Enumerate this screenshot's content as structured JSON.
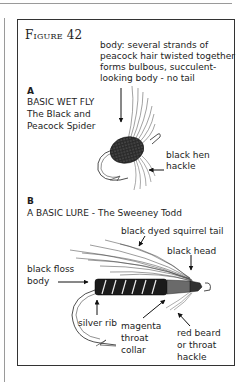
{
  "figure": {
    "title": "Figure 42"
  },
  "section_a": {
    "letter": "A",
    "heading": "BASIC WET FLY",
    "name_line1": "The Black and",
    "name_line2": "Peacock Spider",
    "labels": {
      "body_line1": "body: several strands of",
      "body_line2": "peacock hair twisted together",
      "body_line3": "forms bulbous, succulent-",
      "body_line4": "looking body - no tail",
      "hackle_line1": "black hen",
      "hackle_line2": "hackle"
    }
  },
  "section_b": {
    "letter": "B",
    "heading": "A BASIC LURE - The Sweeney Todd",
    "labels": {
      "tail": "black dyed squirrel tail",
      "head": "black head",
      "body_line1": "black floss",
      "body_line2": "body",
      "rib": "silver rib",
      "collar_line1": "magenta",
      "collar_line2": "throat",
      "collar_line3": "collar",
      "beard_line1": "red beard",
      "beard_line2": "or throat",
      "beard_line3": "hackle"
    }
  },
  "colors": {
    "ink": "#1a1a1a",
    "rule": "#9a9a9a",
    "paper": "#ffffff"
  }
}
